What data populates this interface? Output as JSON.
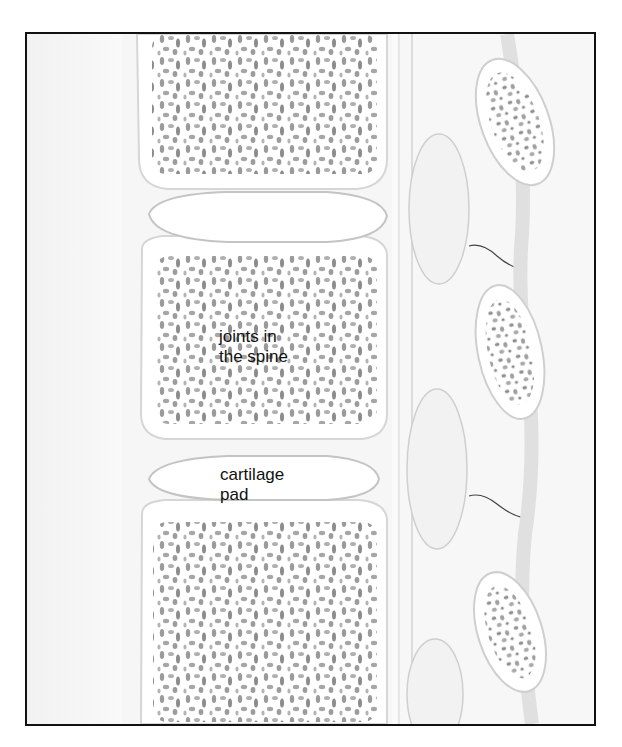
{
  "diagram": {
    "labels": {
      "joints": "joints in\nthe spine",
      "cartilage": "cartilage\npad"
    },
    "colors": {
      "frame": "#111111",
      "bone": "#ffffff",
      "bone_texture": "#8a8a8a",
      "shading": "#e6e6e6",
      "text": "#111111"
    }
  }
}
